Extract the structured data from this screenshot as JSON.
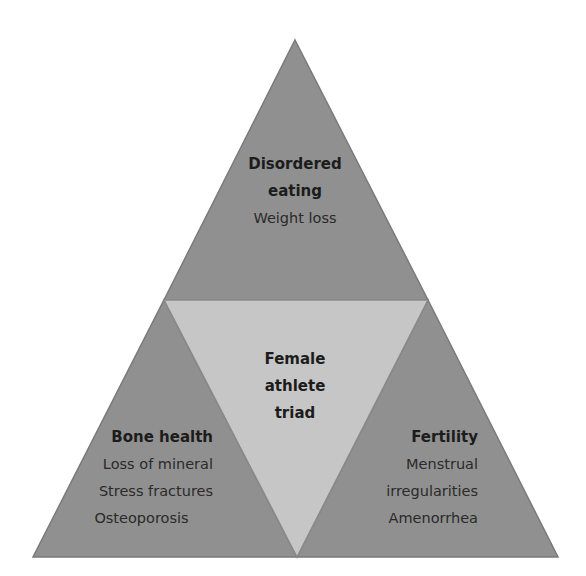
{
  "colors": {
    "outer_fill": "#909090",
    "outer_stroke": "#7a7a7a",
    "inner_fill": "#c6c6c6",
    "background": "#ffffff",
    "text": "#1c1c1c"
  },
  "diagram": {
    "top": {
      "title_lines": [
        "Disordered",
        "eating"
      ],
      "items": [
        "Weight loss"
      ]
    },
    "center": {
      "title_lines": [
        "Female",
        "athlete",
        "triad"
      ]
    },
    "left": {
      "title_lines": [
        "Bone health"
      ],
      "items": [
        "Loss of mineral",
        "Stress fractures",
        "Osteoporosis"
      ]
    },
    "right": {
      "title_lines": [
        "Fertility"
      ],
      "items": [
        "Menstrual",
        "irregularities",
        "Amenorrhea"
      ]
    }
  }
}
